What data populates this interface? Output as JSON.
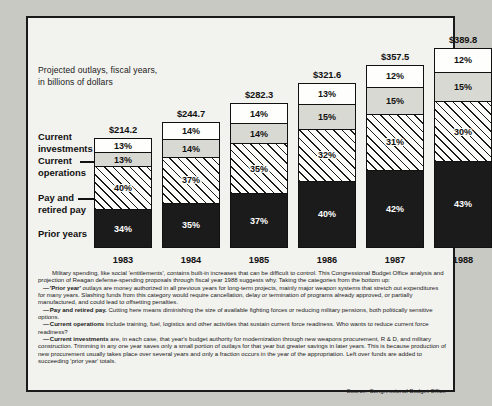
{
  "caption": {
    "line1": "Projected outlays, fiscal years,",
    "line2": "in billions of dollars"
  },
  "category_labels": {
    "investments_l1": "Current",
    "investments_l2": "investments",
    "operations_l1": "Current",
    "operations_l2": "operations",
    "pay_l1": "Pay and",
    "pay_l2": "retired pay",
    "prior": "Prior years"
  },
  "chart_data": {
    "type": "bar",
    "subtype": "stacked-100-percent",
    "title": "Projected outlays, fiscal years, in billions of dollars",
    "xlabel": "",
    "ylabel": "",
    "ylim": [
      0,
      100
    ],
    "grid": false,
    "legend_position": "left-callouts",
    "categories": [
      "1983",
      "1984",
      "1985",
      "1986",
      "1987",
      "1988"
    ],
    "totals": [
      "$214.2",
      "$244.7",
      "$282.3",
      "$321.6",
      "$357.5",
      "$389.8"
    ],
    "totals_numeric": [
      214.2,
      244.7,
      282.3,
      321.6,
      357.5,
      389.8
    ],
    "series": [
      {
        "name": "Prior years",
        "key": "prior",
        "fill": "solid-black",
        "values": [
          34,
          35,
          37,
          40,
          42,
          43
        ],
        "labels": [
          "34%",
          "35%",
          "37%",
          "40%",
          "42%",
          "43%"
        ]
      },
      {
        "name": "Pay and retired pay",
        "key": "pay",
        "fill": "diagonal-hatch",
        "values": [
          40,
          37,
          35,
          32,
          31,
          30
        ],
        "labels": [
          "40%",
          "37%",
          "35%",
          "32%",
          "31%",
          "30%"
        ]
      },
      {
        "name": "Current operations",
        "key": "operations",
        "fill": "light-gray",
        "values": [
          13,
          14,
          14,
          15,
          15,
          15
        ],
        "labels": [
          "13%",
          "14%",
          "14%",
          "15%",
          "15%",
          "15%"
        ]
      },
      {
        "name": "Current investments",
        "key": "investments",
        "fill": "white",
        "values": [
          13,
          14,
          14,
          13,
          12,
          12
        ],
        "labels": [
          "13%",
          "14%",
          "14%",
          "13%",
          "12%",
          "12%"
        ]
      }
    ]
  },
  "body": {
    "p1": "Military spending, like social 'entitlements', contains built-in increases that can be difficult to control. This Congressional Budget Office analysis and projection of Reagan defense-spending proposals through fiscal year 1988 suggests why. Taking the categories from the bottom up:",
    "p2_term": "'Prior year'",
    "p2_rest": " outlays are money authorized in all previous years for long-term projects, mainly major weapon systems that stretch out expenditures for many years. Slashing funds from this category would require cancellation, delay or termination of programs already approved, or partially manufactured, and could lead to offsetting penalties.",
    "p3_term": "Pay and retired pay.",
    "p3_rest": " Cutting here means diminishing the size of available fighting forces or reducing military pensions, both politically sensitive options.",
    "p4_term": "Current operations",
    "p4_rest": " include training, fuel, logistics and other activities that sustain current force readiness. Who wants to reduce current force readiness?",
    "p5_term": "Current investments",
    "p5_rest": " are, in each case, that year's budget authority for modernization through new weapons procurement, R & D, and military construction. Trimming in any one year saves only a small portion of outlays for that year but greater savings in later years. This is because production of new procurement usually takes place over several years and only a fraction occurs in the year of the appropriation. Left over funds are added to succeeding 'prior year' totals.",
    "dash": "—"
  },
  "source": "Source: Congressional Budget Office",
  "colors": {
    "frame": "#1a1a1a",
    "page_background": "#c9c9c4",
    "panel_background": "#f2f2ee",
    "prior_years": "#1b1b1b",
    "current_operations": "#d9d9d4",
    "current_investments": "#fefefc"
  }
}
